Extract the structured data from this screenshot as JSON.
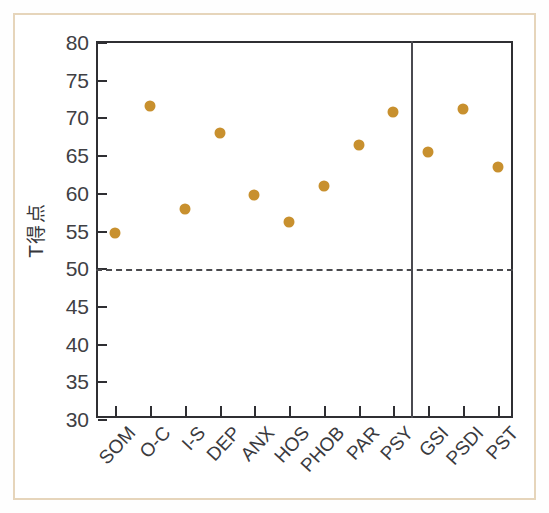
{
  "chart_data": {
    "type": "scatter",
    "title": "",
    "xlabel": "",
    "ylabel": "T得点",
    "ylim": [
      30,
      80
    ],
    "ytick_labels": [
      "80",
      "75",
      "70",
      "65",
      "60",
      "55",
      "50",
      "45",
      "40",
      "35",
      "30"
    ],
    "ytick_values": [
      80,
      75,
      70,
      65,
      60,
      55,
      50,
      45,
      40,
      35,
      30
    ],
    "grid": false,
    "legend": "none",
    "categories": [
      "SOM",
      "O-C",
      "I-S",
      "DEP",
      "ANX",
      "HOS",
      "PHOB",
      "PAR",
      "PSY",
      "GSI",
      "PSDI",
      "PST"
    ],
    "values": [
      54.8,
      71.7,
      58.0,
      68.1,
      59.9,
      56.2,
      61.1,
      66.5,
      70.9,
      65.5,
      71.2,
      63.5
    ],
    "series": [
      {
        "name": "T得点",
        "values": [
          54.8,
          71.7,
          58.0,
          68.1,
          59.9,
          56.2,
          61.1,
          66.5,
          70.9,
          65.5,
          71.2,
          63.5
        ]
      }
    ],
    "annotations": [
      {
        "name": "reference-line",
        "type": "hline",
        "value": 50,
        "style": "dashed",
        "label": ""
      },
      {
        "name": "group-separator",
        "type": "vline",
        "after_category": "PSY",
        "style": "solid",
        "label": ""
      }
    ],
    "colors": {
      "marker": "#c8902e",
      "axis": "#2f2f33",
      "reference_line": "#4a4a4e",
      "separator": "#4a4a50",
      "frame": "#e6d5bb",
      "background": "#ffffff",
      "tick_text": "#404044"
    }
  }
}
